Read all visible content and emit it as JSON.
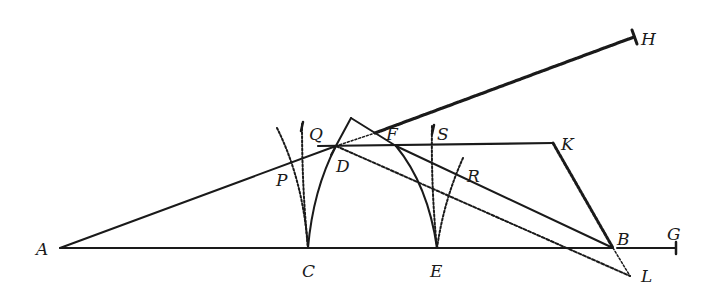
{
  "figure": {
    "type": "geometric-construction",
    "points": {
      "A": {
        "label": "A",
        "x": 60,
        "y": 248
      },
      "C": {
        "label": "C",
        "x": 308,
        "y": 248
      },
      "E": {
        "label": "E",
        "x": 437,
        "y": 248
      },
      "B": {
        "label": "B",
        "x": 613,
        "y": 248
      },
      "G": {
        "label": "G",
        "x": 676,
        "y": 248
      },
      "D": {
        "label": "D",
        "x": 336,
        "y": 146
      },
      "Q": {
        "label": "Q",
        "x": 320,
        "y": 146
      },
      "F": {
        "label": "F",
        "x": 396,
        "y": 146
      },
      "S": {
        "label": "S",
        "x": 432,
        "y": 146
      },
      "K": {
        "label": "K",
        "x": 553,
        "y": 143
      },
      "H": {
        "label": "H",
        "x": 634,
        "y": 33
      },
      "P": {
        "label": "P",
        "x": 291,
        "y": 168
      },
      "R": {
        "label": "R",
        "x": 460,
        "y": 176
      },
      "L": {
        "label": "L",
        "x": 630,
        "y": 276
      },
      "apex": {
        "x": 351,
        "y": 118
      }
    },
    "labels": [
      {
        "id": "A",
        "text": "A",
        "x": 36,
        "y": 255
      },
      {
        "id": "C",
        "text": "C",
        "x": 302,
        "y": 277
      },
      {
        "id": "E",
        "text": "E",
        "x": 430,
        "y": 277
      },
      {
        "id": "B",
        "text": "B",
        "x": 617,
        "y": 245
      },
      {
        "id": "G",
        "text": "G",
        "x": 667,
        "y": 240
      },
      {
        "id": "D",
        "text": "D",
        "x": 336,
        "y": 172
      },
      {
        "id": "Q",
        "text": "Q",
        "x": 309,
        "y": 140
      },
      {
        "id": "F",
        "text": "F",
        "x": 386,
        "y": 140
      },
      {
        "id": "S",
        "text": "S",
        "x": 437,
        "y": 140
      },
      {
        "id": "K",
        "text": "K",
        "x": 561,
        "y": 150
      },
      {
        "id": "H",
        "text": "H",
        "x": 641,
        "y": 45
      },
      {
        "id": "P",
        "text": "P",
        "x": 276,
        "y": 186
      },
      {
        "id": "R",
        "text": "R",
        "x": 467,
        "y": 182
      },
      {
        "id": "L",
        "text": "L",
        "x": 641,
        "y": 282
      }
    ],
    "colors": {
      "ink": "#1a1a1a",
      "background": "#ffffff"
    }
  }
}
